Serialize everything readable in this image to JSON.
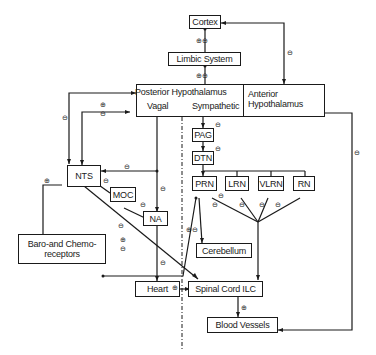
{
  "nodes": {
    "cortex": "Cortex",
    "limbic": "Limbic System",
    "post_hypo": "Posterior Hypothalamus",
    "vagal": "Vagal",
    "sympathetic": "Sympathetic",
    "ant_hypo_1": "Anterior",
    "ant_hypo_2": "Hypothalamus",
    "pag": "PAG",
    "dtn": "DTN",
    "prn": "PRN",
    "lrn": "LRN",
    "vlrn": "VLRN",
    "rn": "RN",
    "nts": "NTS",
    "moc": "MOC",
    "na": "NA",
    "baro_1": "Baro-and Chemo-",
    "baro_2": "receptors",
    "cerebellum": "Cerebellum",
    "heart": "Heart",
    "spinal": "Spinal Cord ILC",
    "blood": "Blood Vessels"
  },
  "signs": {
    "plus": "⊕",
    "minus": "⊖",
    "plusminus": "⊕⊖"
  }
}
